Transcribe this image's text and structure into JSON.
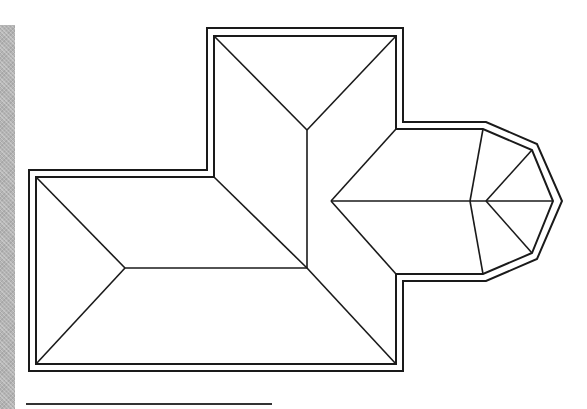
{
  "figure": {
    "colors": {
      "line": "#1a1a1a",
      "background": "#ffffff",
      "side_bar": "#b4b4b4"
    },
    "outer_outline": [
      [
        29,
        170
      ],
      [
        207,
        170
      ],
      [
        207,
        28
      ],
      [
        403,
        28
      ],
      [
        403,
        122
      ],
      [
        486,
        122
      ],
      [
        537,
        144
      ],
      [
        562,
        201
      ],
      [
        537,
        259
      ],
      [
        486,
        281
      ],
      [
        403,
        281
      ],
      [
        403,
        371
      ],
      [
        29,
        371
      ]
    ],
    "inner_outline": [
      [
        36,
        177
      ],
      [
        214,
        177
      ],
      [
        214,
        36
      ],
      [
        396,
        36
      ],
      [
        396,
        129
      ],
      [
        483,
        129
      ],
      [
        532,
        150
      ],
      [
        553,
        201
      ],
      [
        532,
        253
      ],
      [
        483,
        274
      ],
      [
        396,
        274
      ],
      [
        396,
        364
      ],
      [
        36,
        364
      ]
    ],
    "ridge_lines": [
      [
        [
          36,
          177
        ],
        [
          125,
          268
        ]
      ],
      [
        [
          36,
          364
        ],
        [
          125,
          268
        ]
      ],
      [
        [
          125,
          268
        ],
        [
          307,
          268
        ]
      ],
      [
        [
          214,
          177
        ],
        [
          307,
          268
        ]
      ],
      [
        [
          396,
          364
        ],
        [
          307,
          268
        ]
      ],
      [
        [
          307,
          268
        ],
        [
          307,
          130
        ]
      ],
      [
        [
          214,
          36
        ],
        [
          307,
          130
        ]
      ],
      [
        [
          396,
          36
        ],
        [
          307,
          130
        ]
      ],
      [
        [
          396,
          129
        ],
        [
          331,
          201
        ]
      ],
      [
        [
          396,
          274
        ],
        [
          331,
          201
        ]
      ],
      [
        [
          331,
          201
        ],
        [
          553,
          201
        ]
      ],
      [
        [
          483,
          129
        ],
        [
          470,
          201
        ]
      ],
      [
        [
          470,
          201
        ],
        [
          483,
          274
        ]
      ],
      [
        [
          486,
          201
        ],
        [
          532,
          150
        ]
      ],
      [
        [
          486,
          201
        ],
        [
          532,
          253
        ]
      ]
    ]
  }
}
